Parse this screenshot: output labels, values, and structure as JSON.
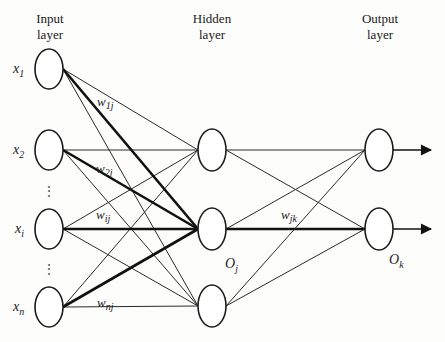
{
  "diagram": {
    "type": "neural-network",
    "layers": [
      {
        "title_line1": "Input",
        "title_line2": "layer"
      },
      {
        "title_line1": "Hidden",
        "title_line2": "layer"
      },
      {
        "title_line1": "Output",
        "title_line2": "layer"
      }
    ],
    "input_nodes": [
      {
        "label": "x",
        "sub": "1"
      },
      {
        "label": "x",
        "sub": "2"
      },
      {
        "label": "x",
        "sub": "i"
      },
      {
        "label": "x",
        "sub": "n"
      }
    ],
    "ellipsis": "⋮",
    "hidden_node_label": {
      "label": "O",
      "sub": "j"
    },
    "output_node_label": {
      "label": "O",
      "sub": "k"
    },
    "weights": [
      {
        "label": "w",
        "sub": "1j"
      },
      {
        "label": "w",
        "sub": "2j"
      },
      {
        "label": "w",
        "sub": "ij"
      },
      {
        "label": "w",
        "sub": "nj"
      },
      {
        "label": "w",
        "sub": "jk"
      }
    ]
  }
}
